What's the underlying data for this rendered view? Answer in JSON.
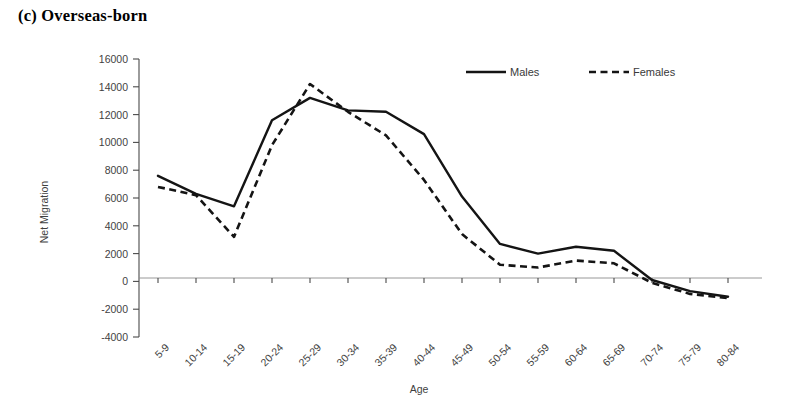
{
  "figure": {
    "panel_label": "(c) Overseas-born"
  },
  "chart_data": {
    "type": "line",
    "title": "(c) Overseas-born",
    "xlabel": "Age",
    "ylabel": "Net Migration",
    "categories": [
      "5-9",
      "10-14",
      "15-19",
      "20-24",
      "25-29",
      "30-34",
      "35-39",
      "40-44",
      "45-49",
      "50-54",
      "55-59",
      "60-64",
      "65-69",
      "70-74",
      "75-79",
      "80-84"
    ],
    "series": [
      {
        "name": "Males",
        "style": "solid",
        "values": [
          7600,
          6300,
          5400,
          11600,
          13200,
          12300,
          12200,
          10600,
          6100,
          2700,
          2000,
          2500,
          2200,
          100,
          -700,
          -1100
        ]
      },
      {
        "name": "Females",
        "style": "dashed",
        "values": [
          6800,
          6200,
          3200,
          9800,
          14200,
          12200,
          10500,
          7300,
          3400,
          1200,
          1000,
          1500,
          1300,
          -100,
          -900,
          -1200
        ]
      }
    ],
    "ylim": [
      -4000,
      16000
    ],
    "ytick_labels": [
      "16000",
      "14000",
      "12000",
      "10000",
      "8000",
      "6000",
      "4000",
      "2000",
      "0",
      "-2000",
      "-4000"
    ],
    "ytick_values": [
      16000,
      14000,
      12000,
      10000,
      8000,
      6000,
      4000,
      2000,
      0,
      -2000,
      -4000
    ],
    "grid": false,
    "legend_position": "top-center",
    "legend_entries": [
      "Males",
      "Females"
    ],
    "zero_line": true
  }
}
